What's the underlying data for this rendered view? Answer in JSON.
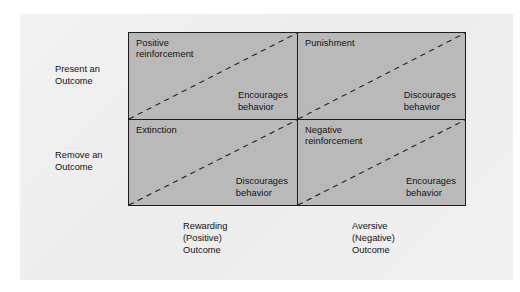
{
  "figure": {
    "type": "2x2-matrix-diagram",
    "topic": "Operant conditioning contingencies"
  },
  "row_labels": [
    {
      "id": "present",
      "text": "Present an\nOutcome"
    },
    {
      "id": "remove",
      "text": "Remove an\nOutcome"
    }
  ],
  "column_labels": [
    {
      "id": "rewarding",
      "text": "Rewarding\n(Positive)\nOutcome"
    },
    {
      "id": "aversive",
      "text": "Aversive\n(Negative)\nOutcome"
    }
  ],
  "quadrants": [
    {
      "id": "positive-reinforcement",
      "row": "present",
      "column": "rewarding",
      "title": "Positive\nreinforcement",
      "effect": "Encourages\nbehavior"
    },
    {
      "id": "punishment",
      "row": "present",
      "column": "aversive",
      "title": "Punishment",
      "effect": "Discourages\nbehavior"
    },
    {
      "id": "extinction",
      "row": "remove",
      "column": "rewarding",
      "title": "Extinction",
      "effect": "Discourages\nbehavior"
    },
    {
      "id": "negative-reinforcement",
      "row": "remove",
      "column": "aversive",
      "title": "Negative\nreinforcement",
      "effect": "Encourages\nbehavior"
    }
  ],
  "colors": {
    "quadrant_fill": "#b9b9b9",
    "page_background": "#ececec",
    "border": "#1d1d1d",
    "text": "#111111",
    "dashed_divider": "#2b2b2b"
  }
}
